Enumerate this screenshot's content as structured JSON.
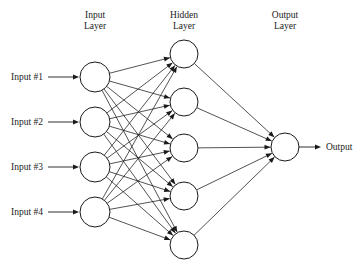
{
  "diagram": {
    "background_color": "#ffffff",
    "stroke_color": "#1a1a1a",
    "headings": {
      "input_layer_line1": "Input",
      "input_layer_line2": "Layer",
      "hidden_layer_line1": "Hidden",
      "hidden_layer_line2": "Layer",
      "output_layer_line1": "Output",
      "output_layer_line2": "Layer"
    },
    "input_labels": [
      "Input #1",
      "Input #2",
      "Input #3",
      "Input #4"
    ],
    "output_label": "Output",
    "layers": {
      "input": {
        "name": "Input Layer",
        "node_count": 4,
        "cx": 95,
        "r": 15,
        "cys": [
          77,
          122,
          167,
          212
        ]
      },
      "hidden": {
        "name": "Hidden Layer",
        "node_count": 5,
        "cx": 184,
        "r": 14,
        "cys": [
          54,
          102,
          148,
          196,
          245
        ]
      },
      "output": {
        "name": "Output Layer",
        "node_count": 1,
        "cx": 285,
        "r": 14,
        "cys": [
          147
        ]
      }
    },
    "heading_positions": {
      "input": {
        "x": 95,
        "y": 18
      },
      "hidden": {
        "x": 184,
        "y": 18
      },
      "output": {
        "x": 285,
        "y": 18
      }
    },
    "edges": {
      "input_to_hidden_count": 20,
      "hidden_to_output_count": 5,
      "arrowheads": "filled-triangle",
      "fully_connected": true
    }
  }
}
